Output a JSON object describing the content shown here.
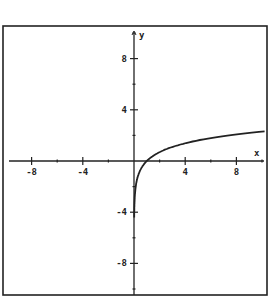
{
  "chart_data": {
    "type": "line",
    "title": "",
    "xlabel": "x",
    "ylabel": "y",
    "xlim": [
      -10.5,
      10.3
    ],
    "ylim": [
      -10.5,
      10.5
    ],
    "x_ticks": [
      -8,
      -4,
      4,
      8
    ],
    "y_ticks": [
      8,
      4,
      -4,
      -8
    ],
    "x_tick_labels": [
      "-8",
      "-4",
      "4",
      "8"
    ],
    "y_tick_labels": [
      "8",
      "4",
      "-4",
      "-8"
    ],
    "grid": false,
    "legend": null,
    "series": [
      {
        "name": "y = ln x",
        "x": [
          0.02,
          0.05,
          0.1,
          0.25,
          0.5,
          1,
          2,
          3,
          4,
          5,
          6,
          7,
          8,
          9,
          10.2
        ],
        "y": [
          -3.9,
          -3.0,
          -2.3,
          -1.39,
          -0.69,
          0,
          0.69,
          1.1,
          1.39,
          1.61,
          1.79,
          1.95,
          2.08,
          2.2,
          2.32
        ]
      }
    ]
  }
}
